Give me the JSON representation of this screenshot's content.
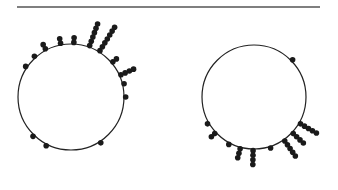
{
  "figure": {
    "rule": {
      "x1": 17,
      "x2": 320,
      "y": 7,
      "color": "#555555"
    },
    "colors": {
      "circle": "#222222",
      "dot": "#1a1a1a",
      "background": "#ffffff"
    },
    "dot_radius": 2.8,
    "dot_spacing": 4.6,
    "plots": [
      {
        "name": "left-circular-plot",
        "center": [
          71,
          97
        ],
        "radius": 53,
        "stacks": [
          {
            "angle_deg": 214,
            "count": 1
          },
          {
            "angle_deg": 228,
            "count": 1
          },
          {
            "angle_deg": 242,
            "count": 2
          },
          {
            "angle_deg": 259,
            "count": 2
          },
          {
            "angle_deg": 273,
            "count": 2
          },
          {
            "angle_deg": 290,
            "count": 6
          },
          {
            "angle_deg": 302,
            "count": 7
          },
          {
            "angle_deg": 320,
            "count": 2
          },
          {
            "angle_deg": 336,
            "count": 4
          },
          {
            "angle_deg": 346,
            "count": 1
          },
          {
            "angle_deg": 0,
            "count": 1
          },
          {
            "angle_deg": 134,
            "count": 1
          },
          {
            "angle_deg": 117,
            "count": 1
          },
          {
            "angle_deg": 57,
            "count": 1
          }
        ]
      },
      {
        "name": "right-circular-plot",
        "center": [
          254,
          97
        ],
        "radius": 52,
        "stacks": [
          {
            "angle_deg": 316,
            "count": 1
          },
          {
            "angle_deg": 150,
            "count": 1
          },
          {
            "angle_deg": 137,
            "count": 2
          },
          {
            "angle_deg": 118,
            "count": 1
          },
          {
            "angle_deg": 105,
            "count": 3
          },
          {
            "angle_deg": 91,
            "count": 4
          },
          {
            "angle_deg": 72,
            "count": 1
          },
          {
            "angle_deg": 55,
            "count": 5
          },
          {
            "angle_deg": 43,
            "count": 4
          },
          {
            "angle_deg": 30,
            "count": 5
          }
        ]
      }
    ]
  }
}
